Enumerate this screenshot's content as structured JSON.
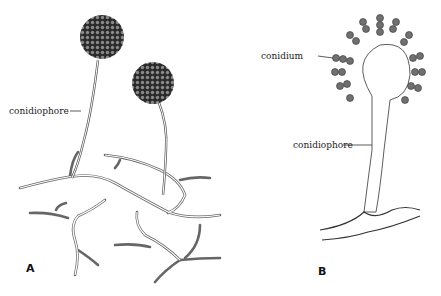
{
  "figure": {
    "panels": [
      {
        "id": "A",
        "label": "A",
        "callouts": [
          "conidiophore"
        ]
      },
      {
        "id": "B",
        "label": "B",
        "callouts": [
          "conidium",
          "conidiophore"
        ]
      }
    ]
  },
  "labels": {
    "a_conidiophore": "conidiophore",
    "b_conidium": "conidium",
    "b_conidiophore": "conidiophore",
    "panel_a": "A",
    "panel_b": "B"
  }
}
